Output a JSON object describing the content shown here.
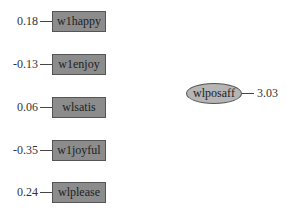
{
  "diagram": {
    "indicators": [
      {
        "name": "w1happy",
        "value": "0.18"
      },
      {
        "name": "w1enjoy",
        "value": "-0.13"
      },
      {
        "name": "wlsatis",
        "value": "0.06"
      },
      {
        "name": "w1joyful",
        "value": "-0.35"
      },
      {
        "name": "wlplease",
        "value": "0.24"
      }
    ],
    "latent": {
      "name": "wlposaff",
      "value": "3.03"
    }
  }
}
